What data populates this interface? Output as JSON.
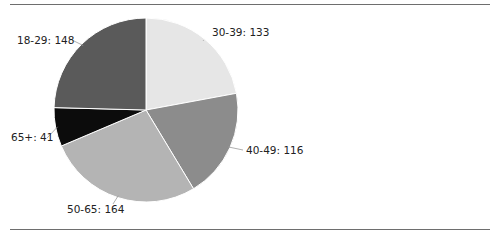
{
  "chart_data": {
    "type": "pie",
    "title": "",
    "categories": [
      "30-39",
      "40-49",
      "50-65",
      "65+",
      "18-29"
    ],
    "values": [
      133,
      116,
      164,
      41,
      148
    ],
    "labels": [
      "30-39: 133",
      "40-49: 116",
      "50-65: 164",
      "65+: 41",
      "18-29: 148"
    ],
    "colors": [
      "#e6e6e6",
      "#8c8c8c",
      "#b4b4b4",
      "#0c0c0c",
      "#5a5a5a"
    ],
    "start_angle": "12 o'clock",
    "direction": "clockwise",
    "legend": "none (inline labels with leader lines)"
  },
  "frame": {
    "top_rule": true,
    "bottom_rule": true
  }
}
